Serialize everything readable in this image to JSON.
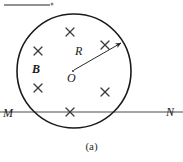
{
  "figure": {
    "caption": "(a)",
    "top_artifact": {
      "name": "top-rule-artifact",
      "x1": 4,
      "y1": 5,
      "x2": 50,
      "y2": 5,
      "marker_x": 52,
      "marker_y": 4,
      "marker_symbol": "°"
    },
    "circle": {
      "name": "field-region-circle",
      "cx": 74,
      "cy": 71,
      "r": 57,
      "stroke": "#1a1a1a",
      "stroke_width": 1.6,
      "fill": "none"
    },
    "center_point": {
      "name": "circle-center",
      "cx": 73,
      "cy": 71,
      "label": "O"
    },
    "radius_arrow": {
      "name": "radius-arrow",
      "x1": 74,
      "y1": 70,
      "x2": 121,
      "y2": 43,
      "label": "R",
      "stroke": "#2a2a2a",
      "stroke_width": 1.0
    },
    "field_label": {
      "name": "magnetic-field-label",
      "text": "B"
    },
    "line_mn": {
      "name": "line-m-n",
      "x1": 0,
      "y1": 112,
      "x2": 183,
      "y2": 112,
      "left_label": "M",
      "right_label": "N",
      "stroke": "#4a4a4a",
      "stroke_width": 1.0
    },
    "field_crosses": [
      {
        "name": "field-cross-1",
        "x": 70,
        "y": 32,
        "size": 8
      },
      {
        "name": "field-cross-2",
        "x": 38,
        "y": 51,
        "size": 8
      },
      {
        "name": "field-cross-3",
        "x": 105,
        "y": 45,
        "size": 8
      },
      {
        "name": "field-cross-4",
        "x": 38,
        "y": 88,
        "size": 8
      },
      {
        "name": "field-cross-5",
        "x": 105,
        "y": 92,
        "size": 8
      },
      {
        "name": "field-cross-6",
        "x": 70,
        "y": 112,
        "size": 8
      }
    ]
  }
}
